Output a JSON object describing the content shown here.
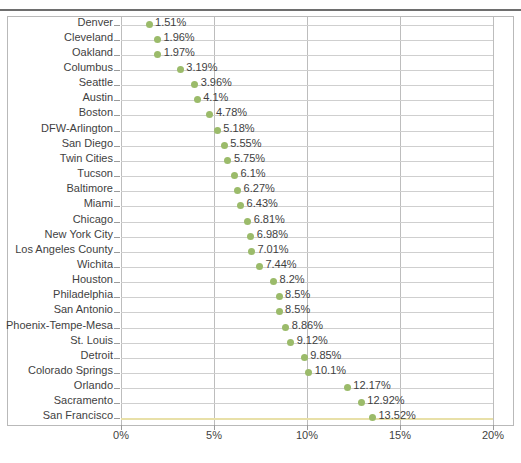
{
  "header": {
    "clipped_text": "",
    "note": ""
  },
  "chart_data": {
    "type": "scatter",
    "title": "",
    "subtitle": "",
    "xlabel": "",
    "ylabel": "",
    "orientation": "horizontal",
    "xlim": [
      0,
      20
    ],
    "xticks": [
      "0%",
      "5%",
      "10%",
      "15%",
      "20%"
    ],
    "xtick_values": [
      0,
      5,
      10,
      15,
      20
    ],
    "grid": "both",
    "legend": "none",
    "marker_color": "#9bbb6a",
    "value_suffix": "%",
    "categories": [
      "Denver",
      "Cleveland",
      "Oakland",
      "Columbus",
      "Seattle",
      "Austin",
      "Boston",
      "DFW-Arlington",
      "San Diego",
      "Twin Cities",
      "Tucson",
      "Baltimore",
      "Miami",
      "Chicago",
      "New York City",
      "Los Angeles County",
      "Wichita",
      "Houston",
      "Philadelphia",
      "San Antonio",
      "Phoenix-Tempe-Mesa",
      "St. Louis",
      "Detroit",
      "Colorado Springs",
      "Orlando",
      "Sacramento",
      "San Francisco"
    ],
    "values": [
      1.51,
      1.96,
      1.97,
      3.19,
      3.96,
      4.1,
      4.78,
      5.18,
      5.55,
      5.75,
      6.1,
      6.27,
      6.43,
      6.81,
      6.98,
      7.01,
      7.44,
      8.2,
      8.5,
      8.5,
      8.86,
      9.12,
      9.85,
      10.1,
      12.17,
      12.92,
      13.52
    ],
    "value_labels": [
      "1.51%",
      "1.96%",
      "1.97%",
      "3.19%",
      "3.96%",
      "4.1%",
      "4.78%",
      "5.18%",
      "5.55%",
      "5.75%",
      "6.1%",
      "6.27%",
      "6.43%",
      "6.81%",
      "6.98%",
      "7.01%",
      "7.44%",
      "8.2%",
      "8.5%",
      "8.5%",
      "8.86%",
      "9.12%",
      "9.85%",
      "10.1%",
      "12.17%",
      "12.92%",
      "13.52%"
    ]
  }
}
